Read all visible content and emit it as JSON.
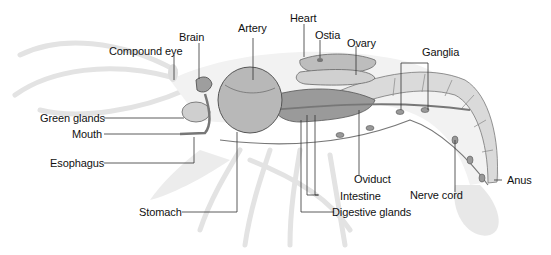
{
  "diagram": {
    "colors": {
      "background": "#ffffff",
      "ghost_outline": "#e6e6e6",
      "organ_fill": "#c9c9c9",
      "organ_dark": "#8a8a8a",
      "leader_line": "#333333",
      "text": "#111111"
    },
    "labels": {
      "heart": "Heart",
      "brain": "Brain",
      "artery": "Artery",
      "ostia": "Ostia",
      "ovary": "Ovary",
      "compound_eye": "Compound eye",
      "ganglia": "Ganglia",
      "green_glands": "Green glands",
      "mouth": "Mouth",
      "esophagus": "Esophagus",
      "oviduct": "Oviduct",
      "anus": "Anus",
      "intestine": "Intestine",
      "nerve_cord": "Nerve cord",
      "stomach": "Stomach",
      "digestive_glands": "Digestive glands"
    }
  }
}
